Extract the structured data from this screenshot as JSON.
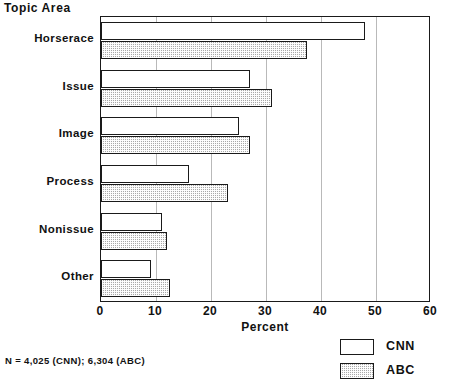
{
  "title": "Topic Area",
  "footnote": "N = 4,025 (CNN); 6,304 (ABC)",
  "axis": {
    "x_title": "Percent",
    "ticks": [
      "0",
      "10",
      "20",
      "30",
      "40",
      "50",
      "60"
    ]
  },
  "legend": {
    "items": [
      {
        "label": "CNN",
        "swatch": "white-open-rect"
      },
      {
        "label": "ABC",
        "swatch": "gray-hatched-rect"
      }
    ]
  },
  "categories": [
    "Horserace",
    "Issue",
    "Image",
    "Process",
    "Nonissue",
    "Other"
  ],
  "chart_data": {
    "type": "bar",
    "orientation": "horizontal",
    "title": "Topic Area",
    "xlabel": "Percent",
    "ylabel": "Topic Area",
    "xlim": [
      0,
      60
    ],
    "xticks": [
      0,
      10,
      20,
      30,
      40,
      50,
      60
    ],
    "grid": true,
    "grid_axis": "x",
    "legend_position": "bottom-right",
    "categories": [
      "Horserace",
      "Issue",
      "Image",
      "Process",
      "Nonissue",
      "Other"
    ],
    "series": [
      {
        "name": "CNN",
        "fill": "white",
        "values": [
          48,
          27,
          25,
          16,
          11,
          9
        ]
      },
      {
        "name": "ABC",
        "fill": "gray-hatch",
        "values": [
          37.5,
          31,
          27,
          23,
          12,
          12.5
        ]
      }
    ],
    "notes": "N = 4,025 (CNN); 6,304 (ABC)"
  },
  "colors": {
    "axis": "#1a1a1a",
    "grid": "#b9b9b9",
    "cnn_fill": "#ffffff",
    "abc_fill": "#a9a9a9",
    "text": "#111111"
  }
}
